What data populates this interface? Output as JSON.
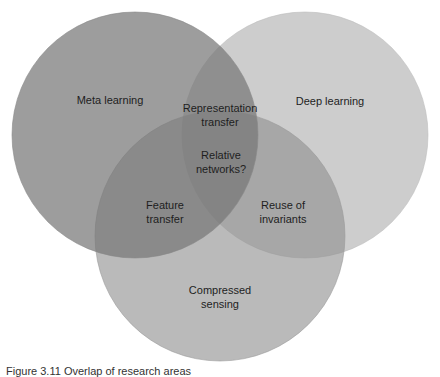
{
  "diagram": {
    "type": "venn",
    "sets": [
      {
        "id": "meta",
        "label": "Meta learning",
        "cx": 135,
        "cy": 135,
        "r": 123,
        "color": "#8e8e8e"
      },
      {
        "id": "deep",
        "label": "Deep learning",
        "cx": 305,
        "cy": 135,
        "r": 123,
        "color": "#d2d2d2"
      },
      {
        "id": "compressed",
        "label": "Compressed\nsensing",
        "cx": 220,
        "cy": 236,
        "r": 125,
        "color": "#ababab"
      }
    ],
    "intersections": {
      "meta_deep": "Representation\ntransfer",
      "meta_compressed": "Feature\ntransfer",
      "deep_compressed": "Reuse of\ninvariants",
      "all": "Relative\nnetworks?"
    },
    "labels": {
      "meta": "Meta learning",
      "deep": "Deep learning",
      "compressed": "Compressed\nsensing",
      "meta_deep": "Representation\ntransfer",
      "center": "Relative\nnetworks?",
      "meta_compressed": "Feature\ntransfer",
      "deep_compressed": "Reuse of\ninvariants"
    }
  },
  "caption": "Figure 3.11  Overlap of research areas"
}
